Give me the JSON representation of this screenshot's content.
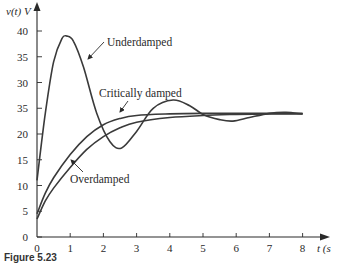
{
  "chart_data": {
    "type": "line",
    "title": "",
    "xlabel": "t (s)",
    "ylabel": "v(t) V",
    "xlim": [
      0,
      8
    ],
    "ylim": [
      0,
      43
    ],
    "grid": false,
    "legend": "none (curves labeled by inline annotations with arrows)",
    "x_ticks": [
      "0",
      "1",
      "2",
      "3",
      "4",
      "5",
      "6",
      "7",
      "8"
    ],
    "y_ticks": [
      "0",
      "5",
      "10",
      "15",
      "20",
      "35",
      "30",
      "35",
      "40"
    ],
    "y_ticks_note": "tick labeled '35' at the 25 V position as printed in the figure",
    "series": [
      {
        "name": "Underdamped",
        "x": [
          0,
          0.25,
          0.5,
          0.75,
          0.9,
          1.1,
          1.4,
          1.8,
          2.2,
          2.55,
          3.0,
          3.5,
          4.1,
          4.6,
          5.0,
          5.5,
          5.9,
          6.4,
          7.0,
          7.5,
          8.0
        ],
        "values": [
          11,
          24,
          34,
          38.5,
          39,
          38,
          33,
          24,
          18.5,
          17.3,
          20.5,
          25,
          26.6,
          25.5,
          23.8,
          22.8,
          22.5,
          23.2,
          24,
          24.2,
          23.9
        ]
      },
      {
        "name": "Critically damped",
        "x": [
          0,
          0.25,
          0.5,
          1.0,
          1.5,
          2.0,
          2.5,
          3.0,
          4.0,
          5.0,
          6.0,
          7.0,
          8.0
        ],
        "values": [
          4.5,
          8.5,
          11.5,
          16,
          19.5,
          21.8,
          23,
          23.6,
          23.9,
          24,
          24,
          24,
          24
        ]
      },
      {
        "name": "Overdamped",
        "x": [
          0,
          0.25,
          0.5,
          1.0,
          1.5,
          2.0,
          2.5,
          3.0,
          4.0,
          5.0,
          6.0,
          7.0,
          8.0
        ],
        "values": [
          3.5,
          7,
          9.5,
          13.5,
          17,
          19.5,
          21.2,
          22.3,
          23.2,
          23.6,
          23.8,
          23.9,
          23.9
        ]
      }
    ],
    "annotations": [
      {
        "text": "Underdamped",
        "points_to": "Underdamped curve near t≈1.4, v≈33"
      },
      {
        "text": "Critically damped",
        "points_to": "Critically damped curve near t≈2.5, v≈23"
      },
      {
        "text": "Overdamped",
        "points_to": "Overdamped curve near t≈1.1, v≈14"
      }
    ]
  },
  "labels": {
    "y_axis_title": "v(t) V",
    "x_axis_title": "t (s",
    "annot_underdamped": "Underdamped",
    "annot_critical": "Critically damped",
    "annot_overdamped": "Overdamped",
    "caption": "Figure 5.23"
  },
  "colors": {
    "curve": "#3a3a3a",
    "axis": "#2a2a2a",
    "text": "#2a2a2a"
  }
}
